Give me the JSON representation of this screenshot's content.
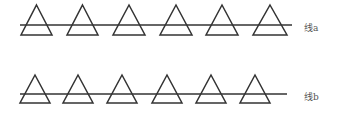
{
  "diagram": {
    "rows": [
      {
        "label": "线a",
        "line": {
          "x1": 20,
          "x2": 292,
          "y": 25
        },
        "triangle_top": 5,
        "triangle_base": 35,
        "triangles": [
          [
            21,
            52
          ],
          [
            67,
            98
          ],
          [
            113,
            145
          ],
          [
            160,
            192
          ],
          [
            206,
            238
          ],
          [
            253,
            287
          ]
        ]
      },
      {
        "label": "线b",
        "line": {
          "x1": 20,
          "x2": 287,
          "y": 94
        },
        "triangle_top": 75,
        "triangle_base": 103,
        "triangles": [
          [
            20,
            50
          ],
          [
            63,
            93
          ],
          [
            107,
            137
          ],
          [
            152,
            182
          ],
          [
            196,
            226
          ],
          [
            240,
            270
          ]
        ]
      }
    ],
    "stroke_color": "#333333"
  }
}
